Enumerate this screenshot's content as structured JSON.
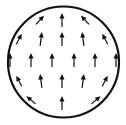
{
  "figure": {
    "background_color": "#ffffff",
    "stroke_color": "#111111",
    "circle": {
      "cx": 63.5,
      "cy": 62,
      "r": 55.5,
      "stroke_width": 2.2
    },
    "arrow_style": {
      "line_width": 1.2,
      "head_length": 5.5,
      "head_width": 5
    },
    "arrows": [
      {
        "x": 40,
        "y": 20,
        "angle": 42,
        "length": 12
      },
      {
        "x": 62,
        "y": 20,
        "angle": 0,
        "length": 14
      },
      {
        "x": 85,
        "y": 20,
        "angle": -42,
        "length": 12
      },
      {
        "x": 19,
        "y": 39,
        "angle": 27,
        "length": 12
      },
      {
        "x": 41,
        "y": 39,
        "angle": 7,
        "length": 14
      },
      {
        "x": 62,
        "y": 39,
        "angle": 0,
        "length": 14
      },
      {
        "x": 83,
        "y": 39,
        "angle": -7,
        "length": 14
      },
      {
        "x": 105,
        "y": 39,
        "angle": -27,
        "length": 12
      },
      {
        "x": 10,
        "y": 60,
        "angle": 0,
        "length": 14
      },
      {
        "x": 31,
        "y": 60,
        "angle": 0,
        "length": 14
      },
      {
        "x": 52,
        "y": 60,
        "angle": 0,
        "length": 14
      },
      {
        "x": 74,
        "y": 60,
        "angle": 0,
        "length": 14
      },
      {
        "x": 95,
        "y": 60,
        "angle": 0,
        "length": 14
      },
      {
        "x": 116,
        "y": 60,
        "angle": 0,
        "length": 14
      },
      {
        "x": 19,
        "y": 81,
        "angle": -27,
        "length": 12
      },
      {
        "x": 41,
        "y": 81,
        "angle": -7,
        "length": 14
      },
      {
        "x": 62,
        "y": 81,
        "angle": 0,
        "length": 14
      },
      {
        "x": 83,
        "y": 81,
        "angle": 7,
        "length": 14
      },
      {
        "x": 105,
        "y": 81,
        "angle": 27,
        "length": 12
      },
      {
        "x": 31,
        "y": 100,
        "angle": -50,
        "length": 12
      },
      {
        "x": 62,
        "y": 103,
        "angle": 0,
        "length": 14
      },
      {
        "x": 96,
        "y": 100,
        "angle": 50,
        "length": 12
      }
    ]
  }
}
